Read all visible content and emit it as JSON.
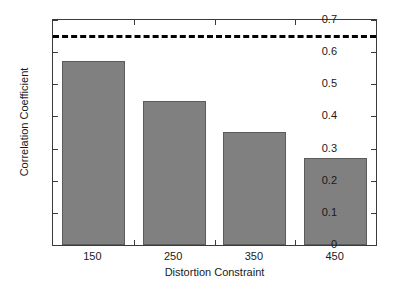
{
  "chart_data": {
    "type": "bar",
    "title": "",
    "xlabel": "Distortion Constraint",
    "ylabel": "Correlation Coefficient",
    "categories": [
      "150",
      "250",
      "350",
      "450"
    ],
    "values": [
      0.572,
      0.447,
      0.351,
      0.271
    ],
    "series": [
      {
        "name": "Correlation Coefficient",
        "values": [
          0.572,
          0.447,
          0.351,
          0.271
        ],
        "color": "#808080"
      }
    ],
    "ylim": [
      0,
      0.7
    ],
    "yticks": [
      "0",
      "0.1",
      "0.2",
      "0.3",
      "0.4",
      "0.5",
      "0.6",
      "0.7"
    ],
    "ytick_values": [
      0,
      0.1,
      0.2,
      0.3,
      0.4,
      0.5,
      0.6,
      0.7
    ],
    "xticks": [
      "150",
      "250",
      "350",
      "450"
    ],
    "grid": false,
    "legend": false,
    "annotations": [
      {
        "name": "reference-threshold",
        "type": "horizontal-dashed-line",
        "value": 0.645,
        "color": "#000000",
        "style": "dashed"
      }
    ],
    "bar_edge_color": "#5c5c5c",
    "axis_color": "#3a3a3a",
    "background": "#ffffff"
  }
}
